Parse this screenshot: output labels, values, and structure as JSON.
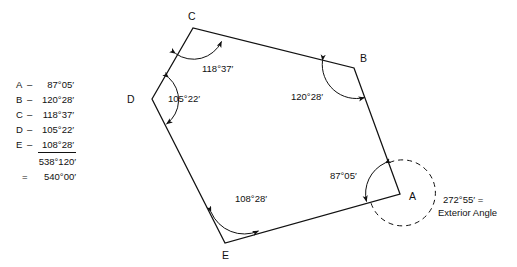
{
  "diagram": {
    "type": "polygon-interior-angles",
    "shape": "pentagon",
    "vertices": [
      {
        "id": "A",
        "label": "A",
        "x": 400,
        "y": 194,
        "label_x": 409,
        "label_y": 200
      },
      {
        "id": "B",
        "label": "B",
        "x": 354,
        "y": 68,
        "label_x": 360,
        "label_y": 62
      },
      {
        "id": "C",
        "label": "C",
        "x": 193,
        "y": 28,
        "label_x": 188,
        "label_y": 20
      },
      {
        "id": "D",
        "label": "D",
        "x": 152,
        "y": 99,
        "label_x": 127,
        "label_y": 103
      },
      {
        "id": "E",
        "label": "E",
        "x": 225,
        "y": 243,
        "label_x": 222,
        "label_y": 259
      }
    ],
    "interior_angle_labels": [
      {
        "vertex": "C",
        "text": "118°37′",
        "x": 202,
        "y": 72
      },
      {
        "vertex": "D",
        "text": "105°22′",
        "x": 168,
        "y": 102
      },
      {
        "vertex": "B",
        "text": "120°28′",
        "x": 291,
        "y": 100
      },
      {
        "vertex": "A",
        "text": "87°05′",
        "x": 330,
        "y": 179
      },
      {
        "vertex": "E",
        "text": "108°28′",
        "x": 235,
        "y": 202
      }
    ],
    "exterior_annotation": {
      "line1": "272°55′ =",
      "line2": "Exterior Angle",
      "x": 443,
      "y1": 203,
      "y2": 216
    }
  },
  "angle_table": {
    "rows": [
      {
        "label": "A",
        "dash": "–",
        "value": "87°05′"
      },
      {
        "label": "B",
        "dash": "–",
        "value": "120°28′"
      },
      {
        "label": "C",
        "dash": "–",
        "value": "118°37′"
      },
      {
        "label": "D",
        "dash": "–",
        "value": "105°22′"
      },
      {
        "label": "E",
        "dash": "–",
        "value": "108°28′"
      }
    ],
    "subtotal": "538°120′",
    "total_prefix": "=",
    "total": "540°00′"
  },
  "style": {
    "stroke": "#111111",
    "background": "#ffffff"
  }
}
